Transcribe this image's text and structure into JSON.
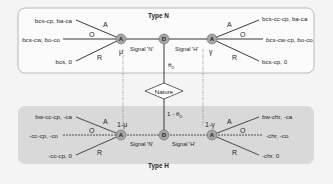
{
  "diagram": {
    "type": "signaling-game-tree",
    "colors": {
      "background": "#f4f4f4",
      "type_n_panel_fill": "#fbfbfb",
      "type_n_panel_border": "#a8a8a8",
      "type_h_panel_fill": "#d9d9d9",
      "node_fill": "#a6a6a6",
      "node_border": "#6a6a6a",
      "line": "#3a3a3a"
    },
    "nature": {
      "label": "Nature",
      "prob_type_n": "θD",
      "prob_type_n_base": "θ",
      "prob_type_n_sub": "D",
      "prob_type_h": "1 - θD",
      "prob_type_h_base": "1 - θ",
      "prob_type_h_sub": "D"
    },
    "type_n": {
      "title": "Type N",
      "sender_node": "D",
      "signals": {
        "left": {
          "label": "Signal 'N'",
          "receiver_node": "A",
          "belief": "μ"
        },
        "right": {
          "label": "Signal 'H'",
          "receiver_node": "A",
          "belief": "γ"
        }
      },
      "left_actions": [
        {
          "action": "A",
          "payoff": "bcs-cp, ba-ca"
        },
        {
          "action": "O",
          "payoff": "bcs-cw, bo-co"
        },
        {
          "action": "R",
          "payoff": "bcs, 0"
        }
      ],
      "right_actions": [
        {
          "action": "A",
          "payoff": "bcs-cc-cp, ba-ca"
        },
        {
          "action": "O",
          "payoff": "bcs-cw-cp, bo-co"
        },
        {
          "action": "R",
          "payoff": "bcs-cp, 0"
        }
      ]
    },
    "type_h": {
      "title": "Type H",
      "sender_node": "D",
      "signals": {
        "left": {
          "label": "Signal 'N'",
          "receiver_node": "A",
          "belief": "1-μ"
        },
        "right": {
          "label": "Signal 'H'",
          "receiver_node": "A",
          "belief": "1-γ"
        }
      },
      "left_actions": [
        {
          "action": "A",
          "payoff": "bw-cc-cp, -ca"
        },
        {
          "action": "O",
          "payoff": "-cc-cp, -co"
        },
        {
          "action": "R",
          "payoff": "-cc-cp, 0"
        }
      ],
      "right_actions": [
        {
          "action": "A",
          "payoff": "bw-chr, -ca"
        },
        {
          "action": "O",
          "payoff": "-chr, -co"
        },
        {
          "action": "R",
          "payoff": "-chr, 0"
        }
      ]
    }
  }
}
